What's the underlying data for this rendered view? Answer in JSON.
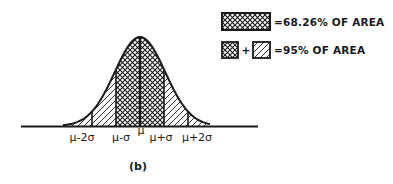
{
  "figure": {
    "caption": "(b)",
    "distribution": "normal",
    "colors": {
      "ink": "#1a1a1a",
      "background": "#ffffff"
    },
    "axis_labels": [
      {
        "key": "mu_minus_2sigma",
        "text": "μ-2σ",
        "offset_sigma": -2
      },
      {
        "key": "mu_minus_sigma",
        "text": "μ-σ",
        "offset_sigma": -1
      },
      {
        "key": "mu",
        "text": "μ",
        "offset_sigma": 0
      },
      {
        "key": "mu_plus_sigma",
        "text": "μ+σ",
        "offset_sigma": 1
      },
      {
        "key": "mu_plus_2sigma",
        "text": "μ+2σ",
        "offset_sigma": 2
      }
    ],
    "regions": [
      {
        "name": "within-1-sigma",
        "from_sigma": -1,
        "to_sigma": 1,
        "pattern": "crosshatch"
      },
      {
        "name": "between-1-and-2-sigma-left",
        "from_sigma": -2,
        "to_sigma": -1,
        "pattern": "diagonal"
      },
      {
        "name": "between-1-and-2-sigma-right",
        "from_sigma": 1,
        "to_sigma": 2,
        "pattern": "diagonal"
      },
      {
        "name": "tail-left",
        "from_sigma": -3,
        "to_sigma": -2,
        "pattern": "diagonal"
      },
      {
        "name": "tail-right",
        "from_sigma": 2,
        "to_sigma": 3,
        "pattern": "diagonal"
      }
    ],
    "legend": [
      {
        "patterns": [
          "crosshatch"
        ],
        "text": "=68.26% OF AREA"
      },
      {
        "patterns": [
          "crosshatch",
          "diagonal"
        ],
        "joiner": "+",
        "text": "=95% OF AREA"
      }
    ]
  }
}
